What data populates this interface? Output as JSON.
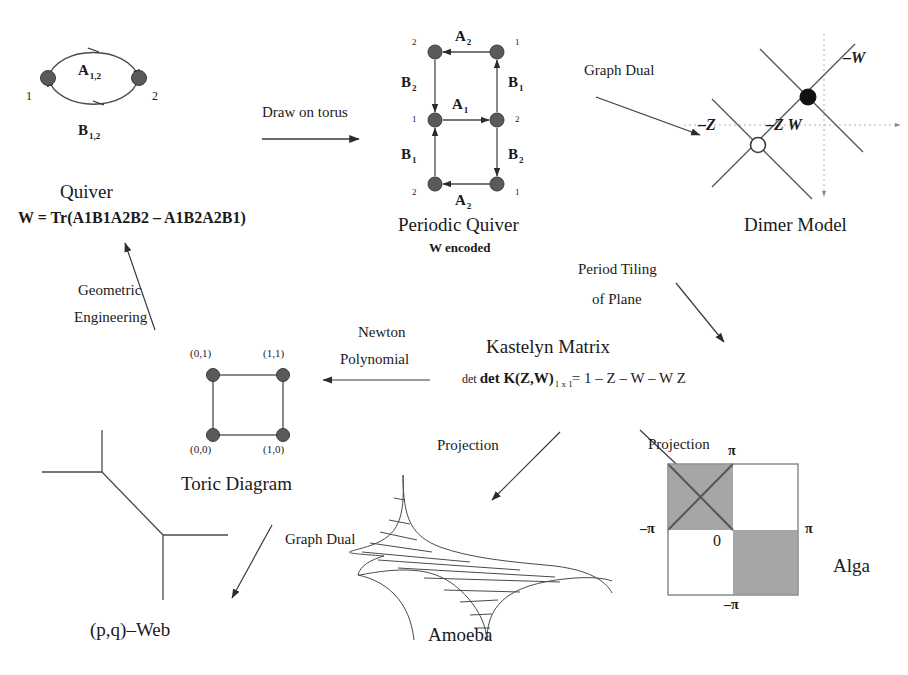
{
  "figure": {
    "type": "flow-diagram",
    "caption": ""
  },
  "quiver": {
    "title": "Quiver",
    "superpotential": "W = Tr(A1B1A2B2 – A1B2A2B1)",
    "nodes": [
      {
        "id": "n1",
        "label": "1",
        "x": 48,
        "y": 78
      },
      {
        "id": "n2",
        "label": "2",
        "x": 139,
        "y": 78
      }
    ],
    "edges": [
      {
        "label": "A",
        "sub": "1,2",
        "direction": "1-to-2",
        "lx": 82,
        "ly": 76
      },
      {
        "label": "B",
        "sub": "1,2",
        "direction": "2-to-1",
        "lx": 82,
        "ly": 133
      }
    ]
  },
  "arrow_draw_on_torus": {
    "label": "Draw on torus"
  },
  "periodic_quiver": {
    "title": "Periodic Quiver",
    "subtitle": "W encoded",
    "nodes": [
      {
        "label": "2",
        "x": 435,
        "y": 52,
        "corner": "top-left"
      },
      {
        "label": "1",
        "x": 497,
        "y": 52,
        "corner": "top-right"
      },
      {
        "label": "1",
        "x": 435,
        "y": 120,
        "corner": "mid-left"
      },
      {
        "label": "2",
        "x": 497,
        "y": 120,
        "corner": "mid-right"
      },
      {
        "label": "2",
        "x": 435,
        "y": 184,
        "corner": "bot-left"
      },
      {
        "label": "1",
        "x": 497,
        "y": 184,
        "corner": "bot-right"
      }
    ],
    "edges": [
      {
        "label": "A",
        "sub": "2",
        "lx": 453,
        "ly": 34
      },
      {
        "label": "B",
        "sub": "2",
        "lx": 404,
        "ly": 80
      },
      {
        "label": "B",
        "sub": "1",
        "lx": 508,
        "ly": 80
      },
      {
        "label": "A",
        "sub": "1",
        "lx": 455,
        "ly": 101
      },
      {
        "label": "B",
        "sub": "1",
        "lx": 404,
        "ly": 152
      },
      {
        "label": "B",
        "sub": "2",
        "lx": 508,
        "ly": 152
      },
      {
        "label": "A",
        "sub": "2",
        "lx": 453,
        "ly": 196
      }
    ]
  },
  "arrow_graph_dual_top": {
    "label": "Graph Dual"
  },
  "dimer": {
    "title": "Dimer Model",
    "labels": [
      {
        "text": "–W",
        "x": 843,
        "y": 58
      },
      {
        "text": "–Z",
        "x": 703,
        "y": 124
      },
      {
        "text": "–Z W",
        "x": 769,
        "y": 124
      }
    ],
    "black_node": {
      "x": 808,
      "y": 97
    },
    "white_node": {
      "x": 758,
      "y": 145
    }
  },
  "arrow_period_tiling": {
    "line1": "Period Tiling",
    "line2": "of Plane"
  },
  "kastelyn": {
    "title": "Kastelyn Matrix",
    "det_prefix": "det K(Z,W)",
    "det_subscript": "1 x 1",
    "det_rhs": "= 1 – Z – W – W Z"
  },
  "arrow_newton": {
    "line1": "Newton",
    "line2": "Polynomial"
  },
  "toric": {
    "title": "Toric Diagram",
    "points": [
      {
        "label": "(0,1)",
        "x": 213,
        "y": 375,
        "lx": 190,
        "ly": 351
      },
      {
        "label": "(1,1)",
        "x": 283,
        "y": 375,
        "lx": 263,
        "ly": 351
      },
      {
        "label": "(0,0)",
        "x": 213,
        "y": 435,
        "lx": 190,
        "ly": 443
      },
      {
        "label": "(1,0)",
        "x": 283,
        "y": 435,
        "lx": 263,
        "ly": 443
      }
    ]
  },
  "arrow_geometric_engineering": {
    "line1": "Geometric",
    "line2": "Engineering"
  },
  "pq_web": {
    "title": "(p,q)–Web"
  },
  "arrow_graph_dual_bottom": {
    "label": "Graph Dual"
  },
  "arrow_projection_amoeba": {
    "label": "Projection"
  },
  "amoeba": {
    "title": "Amoeba"
  },
  "arrow_projection_alga": {
    "label": "Projection"
  },
  "alga": {
    "title": "Alga",
    "axis_labels": {
      "top": "π",
      "left": "–π",
      "right": "π",
      "bottom": "–π",
      "origin": "0"
    }
  },
  "colors": {
    "ink": "#1a1a1a",
    "line": "#555555",
    "node_fill": "#5a5a5a",
    "shade": "#9e9e9e"
  }
}
